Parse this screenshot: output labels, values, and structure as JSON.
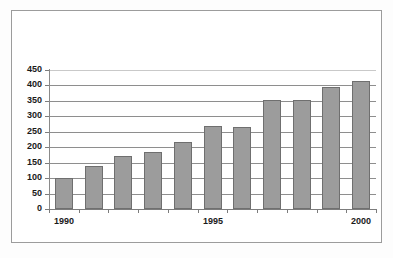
{
  "figure": {
    "frame_color": "#9c9c9c",
    "background": "#ffffff"
  },
  "chart_data": {
    "type": "bar",
    "title": "",
    "subtitle": "",
    "xlabel": "",
    "ylabel": "",
    "categories": [
      "1990",
      "1991",
      "1992",
      "1993",
      "1994",
      "1995",
      "1996",
      "1997",
      "1998",
      "1999",
      "2000"
    ],
    "values": [
      100,
      140,
      173,
      183,
      217,
      268,
      266,
      352,
      354,
      395,
      414
    ],
    "xtick_labels": [
      "1990",
      "1995",
      "2000"
    ],
    "xtick_label_categories": [
      "1990",
      "1995",
      "2000"
    ],
    "ytick_labels": [
      "0",
      "50",
      "100",
      "150",
      "200",
      "250",
      "300",
      "350",
      "400",
      "450"
    ],
    "ytick_values": [
      0,
      50,
      100,
      150,
      200,
      250,
      300,
      350,
      400,
      450
    ],
    "ylim": [
      0,
      450
    ],
    "grid": true,
    "grid_axis": "y",
    "legend": false,
    "legend_position": "none",
    "bar_color": "#9c9c9c",
    "bar_edge_color": "#6f6f6f",
    "grid_color": "#8e8e8e",
    "axis_color": "#7c7c7c",
    "text_color": "#1a1a1a"
  }
}
